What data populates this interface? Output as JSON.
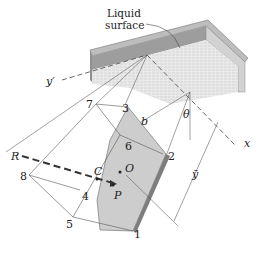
{
  "caption": {
    "line1": "Liquid",
    "line2": "surface"
  },
  "axes": {
    "y_prime": "y′",
    "x": "x",
    "theta": "θ",
    "y_bar": "ȳ"
  },
  "points": {
    "p1": "1",
    "p2": "2",
    "p3": "3",
    "p4": "4",
    "p5": "5",
    "p6": "6",
    "p7": "7",
    "p8": "8"
  },
  "labels": {
    "R": "R",
    "C": "C",
    "O": "O",
    "P": "P",
    "b": "b"
  },
  "colors": {
    "plate_face": "#cfcfcf",
    "plate_edge": "#8a8a8a",
    "surface": "#e6e6e6",
    "wall_dark": "#9a9a9a",
    "wall_light": "#d9d9d9",
    "line": "#444444",
    "resultant": "#333333"
  }
}
